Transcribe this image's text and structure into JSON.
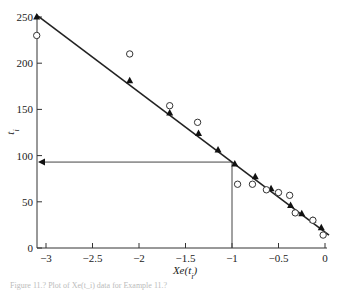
{
  "chart_data": {
    "type": "scatter",
    "title": "",
    "xlabel": "Xe(t_i)",
    "ylabel": "t_i",
    "xlim": [
      -3.1,
      0
    ],
    "ylim": [
      0,
      250
    ],
    "x_ticks": [
      -3,
      -2.5,
      -2,
      -1.5,
      -1,
      -0.5,
      0
    ],
    "x_tick_labels": [
      "−3",
      "−2.5",
      "−2",
      "−1.5",
      "−1",
      "−0.5",
      "0"
    ],
    "y_ticks": [
      0,
      50,
      100,
      150,
      200,
      250
    ],
    "y_tick_labels": [
      "0",
      "50",
      "100",
      "150",
      "200",
      "250"
    ],
    "grid": false,
    "series": [
      {
        "name": "fitted",
        "marker": "filled-triangle",
        "line": true,
        "x": [
          -3.1,
          -2.1,
          -1.67,
          -1.36,
          -1.15,
          -0.97,
          -0.75,
          -0.58,
          -0.37,
          -0.25,
          -0.13,
          -0.04
        ],
        "y": [
          250,
          181,
          146,
          124,
          106,
          91,
          77,
          64,
          46,
          37,
          30,
          22
        ]
      },
      {
        "name": "observed",
        "marker": "open-circle",
        "line": false,
        "x": [
          -3.1,
          -2.1,
          -1.67,
          -1.37,
          -0.94,
          -0.78,
          -0.63,
          -0.5,
          -0.38,
          -0.32,
          -0.13,
          -0.02
        ],
        "y": [
          230,
          210,
          154,
          136,
          69,
          69,
          63,
          60,
          57,
          38,
          30,
          14
        ]
      }
    ],
    "annotations": [
      {
        "type": "guide",
        "from": [
          -1,
          0
        ],
        "to": [
          -1,
          93
        ],
        "description": "vertical line at x = -1"
      },
      {
        "type": "arrow",
        "from": [
          -1,
          93
        ],
        "to": [
          -3.1,
          93
        ],
        "description": "horizontal arrow to y-axis at t ≈ 93"
      }
    ],
    "fit_line": {
      "x": [
        -3.1,
        0
      ],
      "y": [
        252,
        14
      ]
    }
  },
  "labels": {
    "xlabel": "Xe(t",
    "xlabel_sub": "i",
    "xlabel_close": ")",
    "ylabel": "t",
    "ylabel_sub": "i"
  },
  "caption": "Figure 11.?  Plot of Xe(t_i) data for Example 11.?"
}
